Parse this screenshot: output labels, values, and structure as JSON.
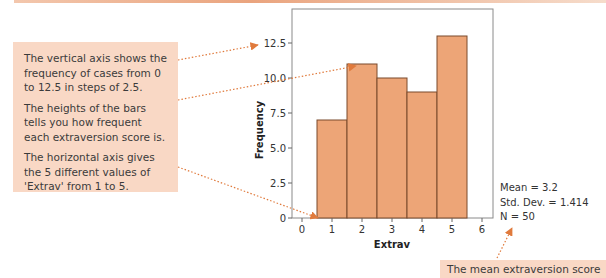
{
  "annotations": {
    "vertical_axis": "The vertical axis shows the frequency of cases from 0 to 12.5 in steps of 2.5.",
    "bar_heights": "The heights of the bars tells you how frequent each extraversion score is.",
    "horizontal_axis": "The horizontal axis gives the 5 different values of 'Extrav' from 1 to 5.",
    "mean": "The mean extraversion score is 3.2."
  },
  "stats": {
    "mean": "Mean = 3.2",
    "std_dev": "Std. Dev. = 1.414",
    "n": "N = 50"
  },
  "colors": {
    "bar_fill": "#eda577",
    "bar_stroke": "#7a4a2c",
    "note_bg": "#f9d8c5",
    "arrow": "#e07a3c"
  },
  "chart_data": {
    "type": "bar",
    "title": "",
    "xlabel": "Extrav",
    "ylabel": "Frequency",
    "categories": [
      "1",
      "2",
      "3",
      "4",
      "5"
    ],
    "values": [
      7,
      11,
      10,
      9,
      13
    ],
    "x_ticks": [
      "0",
      "1",
      "2",
      "3",
      "4",
      "5",
      "6"
    ],
    "y_ticks": [
      "0",
      "2.5",
      "5.0",
      "7.5",
      "10.0",
      "12.5"
    ],
    "xlim": [
      -0.33,
      6.37
    ],
    "ylim": [
      0,
      14.9
    ],
    "grid": false,
    "legend": "none",
    "stats_box": {
      "mean": 3.2,
      "std_dev": 1.414,
      "n": 50
    }
  }
}
